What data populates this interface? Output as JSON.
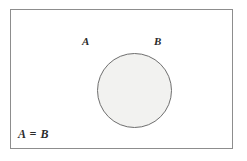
{
  "figure": {
    "background_color": "#ffffff"
  },
  "universe": {
    "name": "universal-set-rectangle",
    "border_color": "#8d8d8d",
    "fill_color": "#ffffff"
  },
  "circle": {
    "name": "set-circle",
    "fill_color": "#f2f2f0",
    "stroke_color": "#6f6f6f",
    "center_x": 123,
    "center_y": 80,
    "radius": 37
  },
  "labels": {
    "set_a": "A",
    "set_b": "B",
    "caption": "A = B",
    "text_color": "#2b2b2b"
  }
}
